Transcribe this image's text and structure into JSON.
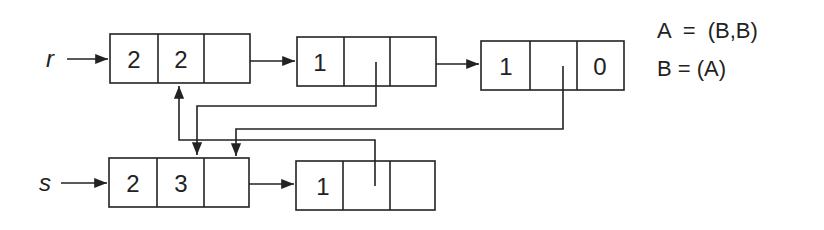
{
  "diagram": {
    "variables": [
      {
        "name": "r",
        "label": "r"
      },
      {
        "name": "s",
        "label": "s"
      }
    ],
    "lists": {
      "r": [
        {
          "cells": [
            "2",
            "2",
            ""
          ]
        },
        {
          "cells": [
            "1",
            "",
            ""
          ]
        },
        {
          "cells": [
            "1",
            "",
            "0"
          ]
        }
      ],
      "s": [
        {
          "cells": [
            "2",
            "3",
            ""
          ]
        },
        {
          "cells": [
            "1",
            "",
            ""
          ]
        }
      ]
    },
    "equations": [
      {
        "text": "A  =  (B,B)"
      },
      {
        "text": "B = (A)"
      }
    ],
    "colors": {
      "line": "#222222",
      "background": "#ffffff"
    }
  }
}
